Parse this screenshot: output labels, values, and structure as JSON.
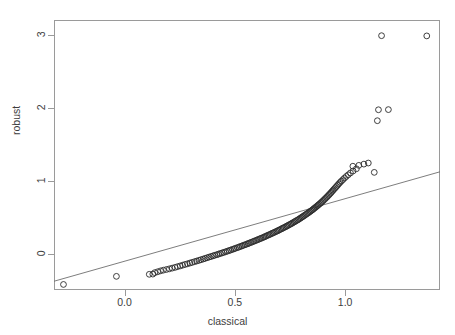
{
  "chart_data": {
    "type": "scatter",
    "title": "",
    "xlabel": "classical",
    "ylabel": "robust",
    "xlim": [
      -0.32,
      1.43
    ],
    "ylim": [
      -0.5,
      3.2
    ],
    "xticks": [
      0.0,
      0.5,
      1.0
    ],
    "xtick_labels": [
      "0.0",
      "0.5",
      "1.0"
    ],
    "yticks": [
      0,
      1,
      2,
      3
    ],
    "ytick_labels": [
      "0",
      "1",
      "2",
      "3"
    ],
    "grid": false,
    "legend": null,
    "marker": "open-circle",
    "annotations": [],
    "reference_line": {
      "type": "line",
      "description": "straight reference line drawn across the panel",
      "x": [
        -0.32,
        1.43
      ],
      "y": [
        -0.38,
        1.12
      ]
    },
    "points": [
      {
        "x": -0.277,
        "y": -0.424
      },
      {
        "x": -0.037,
        "y": -0.313
      },
      {
        "x": 0.112,
        "y": -0.285
      },
      {
        "x": 0.128,
        "y": -0.282
      },
      {
        "x": 0.137,
        "y": -0.262
      },
      {
        "x": 0.15,
        "y": -0.25
      },
      {
        "x": 0.163,
        "y": -0.238
      },
      {
        "x": 0.176,
        "y": -0.228
      },
      {
        "x": 0.19,
        "y": -0.219
      },
      {
        "x": 0.203,
        "y": -0.21
      },
      {
        "x": 0.216,
        "y": -0.2
      },
      {
        "x": 0.229,
        "y": -0.19
      },
      {
        "x": 0.24,
        "y": -0.18
      },
      {
        "x": 0.252,
        "y": -0.17
      },
      {
        "x": 0.263,
        "y": -0.16
      },
      {
        "x": 0.274,
        "y": -0.15
      },
      {
        "x": 0.285,
        "y": -0.141
      },
      {
        "x": 0.296,
        "y": -0.131
      },
      {
        "x": 0.306,
        "y": -0.122
      },
      {
        "x": 0.317,
        "y": -0.112
      },
      {
        "x": 0.327,
        "y": -0.103
      },
      {
        "x": 0.337,
        "y": -0.094
      },
      {
        "x": 0.346,
        "y": -0.085
      },
      {
        "x": 0.356,
        "y": -0.076
      },
      {
        "x": 0.365,
        "y": -0.067
      },
      {
        "x": 0.374,
        "y": -0.058
      },
      {
        "x": 0.383,
        "y": -0.049
      },
      {
        "x": 0.392,
        "y": -0.041
      },
      {
        "x": 0.401,
        "y": -0.032
      },
      {
        "x": 0.409,
        "y": -0.024
      },
      {
        "x": 0.418,
        "y": -0.016
      },
      {
        "x": 0.426,
        "y": -0.008
      },
      {
        "x": 0.434,
        "y": 0.0
      },
      {
        "x": 0.442,
        "y": 0.008
      },
      {
        "x": 0.45,
        "y": 0.016
      },
      {
        "x": 0.458,
        "y": 0.024
      },
      {
        "x": 0.466,
        "y": 0.032
      },
      {
        "x": 0.474,
        "y": 0.04
      },
      {
        "x": 0.481,
        "y": 0.048
      },
      {
        "x": 0.489,
        "y": 0.056
      },
      {
        "x": 0.496,
        "y": 0.064
      },
      {
        "x": 0.503,
        "y": 0.072
      },
      {
        "x": 0.511,
        "y": 0.08
      },
      {
        "x": 0.518,
        "y": 0.088
      },
      {
        "x": 0.525,
        "y": 0.096
      },
      {
        "x": 0.532,
        "y": 0.104
      },
      {
        "x": 0.539,
        "y": 0.112
      },
      {
        "x": 0.546,
        "y": 0.12
      },
      {
        "x": 0.553,
        "y": 0.128
      },
      {
        "x": 0.56,
        "y": 0.136
      },
      {
        "x": 0.566,
        "y": 0.144
      },
      {
        "x": 0.573,
        "y": 0.152
      },
      {
        "x": 0.58,
        "y": 0.16
      },
      {
        "x": 0.586,
        "y": 0.168
      },
      {
        "x": 0.593,
        "y": 0.176
      },
      {
        "x": 0.599,
        "y": 0.184
      },
      {
        "x": 0.606,
        "y": 0.192
      },
      {
        "x": 0.612,
        "y": 0.2
      },
      {
        "x": 0.618,
        "y": 0.208
      },
      {
        "x": 0.625,
        "y": 0.216
      },
      {
        "x": 0.631,
        "y": 0.224
      },
      {
        "x": 0.637,
        "y": 0.232
      },
      {
        "x": 0.643,
        "y": 0.241
      },
      {
        "x": 0.649,
        "y": 0.249
      },
      {
        "x": 0.655,
        "y": 0.257
      },
      {
        "x": 0.661,
        "y": 0.265
      },
      {
        "x": 0.667,
        "y": 0.274
      },
      {
        "x": 0.673,
        "y": 0.282
      },
      {
        "x": 0.679,
        "y": 0.29
      },
      {
        "x": 0.685,
        "y": 0.299
      },
      {
        "x": 0.691,
        "y": 0.307
      },
      {
        "x": 0.697,
        "y": 0.316
      },
      {
        "x": 0.702,
        "y": 0.324
      },
      {
        "x": 0.708,
        "y": 0.333
      },
      {
        "x": 0.714,
        "y": 0.342
      },
      {
        "x": 0.719,
        "y": 0.35
      },
      {
        "x": 0.725,
        "y": 0.359
      },
      {
        "x": 0.731,
        "y": 0.368
      },
      {
        "x": 0.736,
        "y": 0.377
      },
      {
        "x": 0.742,
        "y": 0.386
      },
      {
        "x": 0.747,
        "y": 0.395
      },
      {
        "x": 0.753,
        "y": 0.404
      },
      {
        "x": 0.758,
        "y": 0.413
      },
      {
        "x": 0.763,
        "y": 0.422
      },
      {
        "x": 0.769,
        "y": 0.432
      },
      {
        "x": 0.774,
        "y": 0.441
      },
      {
        "x": 0.779,
        "y": 0.451
      },
      {
        "x": 0.785,
        "y": 0.46
      },
      {
        "x": 0.79,
        "y": 0.47
      },
      {
        "x": 0.795,
        "y": 0.48
      },
      {
        "x": 0.8,
        "y": 0.49
      },
      {
        "x": 0.805,
        "y": 0.5
      },
      {
        "x": 0.81,
        "y": 0.51
      },
      {
        "x": 0.815,
        "y": 0.52
      },
      {
        "x": 0.82,
        "y": 0.531
      },
      {
        "x": 0.825,
        "y": 0.541
      },
      {
        "x": 0.83,
        "y": 0.552
      },
      {
        "x": 0.835,
        "y": 0.562
      },
      {
        "x": 0.84,
        "y": 0.573
      },
      {
        "x": 0.845,
        "y": 0.584
      },
      {
        "x": 0.85,
        "y": 0.595
      },
      {
        "x": 0.855,
        "y": 0.606
      },
      {
        "x": 0.859,
        "y": 0.618
      },
      {
        "x": 0.864,
        "y": 0.629
      },
      {
        "x": 0.869,
        "y": 0.641
      },
      {
        "x": 0.874,
        "y": 0.653
      },
      {
        "x": 0.878,
        "y": 0.665
      },
      {
        "x": 0.883,
        "y": 0.677
      },
      {
        "x": 0.888,
        "y": 0.689
      },
      {
        "x": 0.892,
        "y": 0.702
      },
      {
        "x": 0.897,
        "y": 0.714
      },
      {
        "x": 0.901,
        "y": 0.727
      },
      {
        "x": 0.906,
        "y": 0.74
      },
      {
        "x": 0.91,
        "y": 0.754
      },
      {
        "x": 0.915,
        "y": 0.767
      },
      {
        "x": 0.919,
        "y": 0.781
      },
      {
        "x": 0.924,
        "y": 0.795
      },
      {
        "x": 0.928,
        "y": 0.81
      },
      {
        "x": 0.933,
        "y": 0.824
      },
      {
        "x": 0.937,
        "y": 0.839
      },
      {
        "x": 0.942,
        "y": 0.855
      },
      {
        "x": 0.946,
        "y": 0.87
      },
      {
        "x": 0.951,
        "y": 0.886
      },
      {
        "x": 0.956,
        "y": 0.903
      },
      {
        "x": 0.961,
        "y": 0.92
      },
      {
        "x": 0.966,
        "y": 0.937
      },
      {
        "x": 0.971,
        "y": 0.955
      },
      {
        "x": 0.977,
        "y": 0.974
      },
      {
        "x": 0.983,
        "y": 0.993
      },
      {
        "x": 0.99,
        "y": 1.013
      },
      {
        "x": 0.997,
        "y": 1.034
      },
      {
        "x": 1.005,
        "y": 1.056
      },
      {
        "x": 1.014,
        "y": 1.079
      },
      {
        "x": 1.024,
        "y": 1.104
      },
      {
        "x": 1.036,
        "y": 1.131
      },
      {
        "x": 1.051,
        "y": 1.161
      },
      {
        "x": 1.035,
        "y": 1.196
      },
      {
        "x": 1.062,
        "y": 1.208
      },
      {
        "x": 1.085,
        "y": 1.225
      },
      {
        "x": 1.105,
        "y": 1.24
      },
      {
        "x": 1.132,
        "y": 1.112
      },
      {
        "x": 1.151,
        "y": 1.97
      },
      {
        "x": 1.196,
        "y": 1.972
      },
      {
        "x": 1.146,
        "y": 1.82
      },
      {
        "x": 1.165,
        "y": 2.985
      },
      {
        "x": 1.37,
        "y": 2.982
      }
    ]
  }
}
